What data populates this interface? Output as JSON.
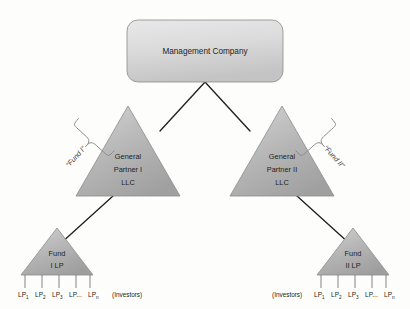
{
  "diagram": {
    "background_color": "#fdfdfc",
    "line_color": "#231f20",
    "shape_fill_light": "#d8d8d8",
    "shape_fill_dark": "#a3a3a3",
    "shape_stroke": "#8c8c8c"
  },
  "management": {
    "label": "Management Company"
  },
  "general_partners": [
    {
      "line1": "General",
      "line2": "Partner I",
      "line3": "LLC"
    },
    {
      "line1": "General",
      "line2": "Partner II",
      "line3": "LLC"
    }
  ],
  "funds": [
    {
      "line1": "Fund",
      "line2": "I LP"
    },
    {
      "line1": "Fund",
      "line2": "II LP"
    }
  ],
  "brace_labels": [
    {
      "text": "“Fund I”"
    },
    {
      "text": "“Fund II”"
    }
  ],
  "investors_label": "(Investors)",
  "limited_partners": [
    {
      "base": "LP",
      "sub": "1"
    },
    {
      "base": "LP",
      "sub": "2"
    },
    {
      "base": "LP",
      "sub": "3"
    },
    {
      "base": "LP...",
      "sub": ""
    },
    {
      "base": "LP",
      "sub": "n"
    }
  ]
}
